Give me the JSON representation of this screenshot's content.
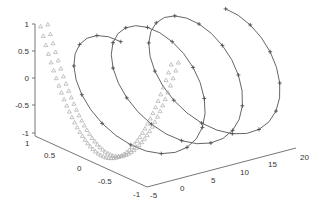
{
  "chart_data": {
    "type": "line3d",
    "title": "",
    "xlabel": "",
    "ylabel": "",
    "zlabel": "",
    "grid": false,
    "legend": null,
    "axes": {
      "x": {
        "ticks": [
          -5,
          0,
          5,
          10,
          15,
          20
        ],
        "range": [
          -5,
          20
        ]
      },
      "y": {
        "ticks": [
          1,
          0.5,
          0,
          -0.5,
          -1
        ],
        "range": [
          -1,
          1
        ]
      },
      "z": {
        "ticks": [
          1,
          0.5,
          0,
          -0.5,
          -1
        ],
        "range": [
          -1,
          1
        ]
      }
    },
    "series": [
      {
        "name": "helix",
        "marker": "plus",
        "color": "#666666",
        "description": "3D helix x=t, y=sin(t), z=cos(t), ~3 turns over x from 0 to ~19"
      },
      {
        "name": "curve",
        "marker": "triangle",
        "color": "#aaaaaa",
        "description": "V/U-shaped curve near x from -5 to 0, dense triangle markers"
      }
    ]
  },
  "labels": {
    "z_ticks": [
      "1",
      "0.5",
      "0",
      "-0.5",
      "-1"
    ],
    "y_ticks": [
      "1",
      "0.5",
      "0",
      "-0.5",
      "-1"
    ],
    "x_ticks": [
      "-5",
      "0",
      "5",
      "10",
      "15",
      "20"
    ]
  }
}
